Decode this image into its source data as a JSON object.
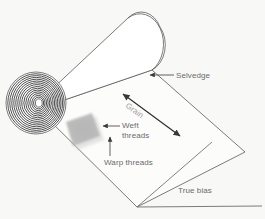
{
  "figure": {
    "background_color": "#f8f8f6",
    "line_color": "#5a5a5a",
    "text_color": "#6b6b6b"
  },
  "labels": {
    "selvedge": "Selvedge",
    "grain": "Grain",
    "weft_line1": "Weft",
    "weft_line2": "threads",
    "warp": "Warp threads",
    "true_bias": "True bias"
  },
  "parts": {
    "roll": "fabric-roll-cylinder",
    "spiral": "rolled-fabric-spiral-end",
    "sheet": "unrolled-fabric-sheet",
    "weave_patch": "woven-thread-texture-patch"
  }
}
